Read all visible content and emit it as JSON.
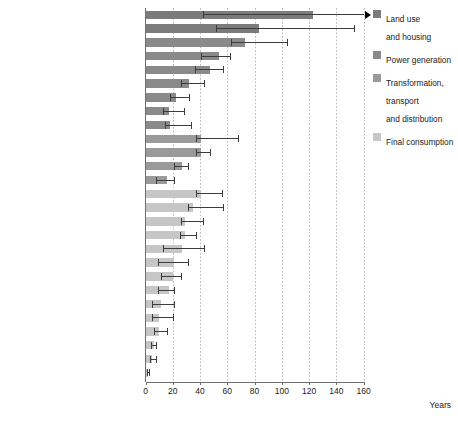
{
  "chart_data": {
    "type": "bar",
    "title": "",
    "xlabel": "Years",
    "ylabel": "",
    "xlim": [
      0,
      160
    ],
    "xticks": [
      0,
      20,
      40,
      60,
      80,
      100,
      120,
      140,
      160
    ],
    "grid": "vertical dotted gridlines at each x tick",
    "orientation": "horizontal",
    "legend_position": "right",
    "value_unit": "years",
    "legend": [
      {
        "label": "Land use\nand housing",
        "color": "#7b7b7b"
      },
      {
        "label": "Power generation",
        "color": "#8a8a8a"
      },
      {
        "label": "Transformation,\ntransport\nand distribution",
        "color": "#9a9a9a"
      },
      {
        "label": "Final consumption",
        "color": "#c6c6c6"
      }
    ],
    "categories": [
      "Urban infrastructure (e.g. roads)",
      "Building stock",
      "Large hydropower plant",
      "Nuclear power plant",
      "Coal-fired power plant",
      "Combined-cycle gas turbine plant",
      "Offshore wind turbines",
      "Onshore wind turbines",
      "Solar photovoltaics",
      "Transmission and distribution networks",
      "Pipelines",
      "Oil refineries",
      "Refueling stations",
      "Cement plant",
      "Steel plant",
      "Petrochemical plant",
      "Aircraft",
      "Manufacturing equipment",
      "Residential space heating and cooling",
      "Commercial heating and cooling",
      "Passenger cars",
      "Household appliances",
      "Residential water heating",
      "Consumer electronics",
      "Light bulbs (fluorescent)",
      "Office equipment",
      "Light bulbs (incandescent)"
    ],
    "series": [
      {
        "name": "Typical lifetime",
        "values": [
          123,
          83,
          73,
          54,
          47,
          32,
          22,
          17,
          18,
          41,
          41,
          27,
          16,
          41,
          35,
          29,
          29,
          27,
          21,
          20,
          17,
          11,
          10,
          10,
          6,
          5,
          1.5
        ],
        "low": [
          42,
          52,
          63,
          41,
          36,
          26,
          18,
          13,
          14,
          37,
          37,
          21,
          8,
          37,
          31,
          26,
          25,
          13,
          9,
          11,
          9,
          5,
          5,
          6,
          4,
          3.5,
          0.7
        ],
        "high": [
          160,
          153,
          104,
          62,
          57,
          43,
          32,
          28,
          33,
          68,
          47,
          31,
          21,
          56,
          57,
          42,
          37,
          43,
          31,
          26,
          21,
          21,
          20,
          16,
          8,
          8,
          2.5
        ],
        "high_open": [
          true,
          false,
          false,
          false,
          false,
          false,
          false,
          false,
          false,
          false,
          false,
          false,
          false,
          false,
          false,
          false,
          false,
          false,
          false,
          false,
          false,
          false,
          false,
          false,
          false,
          false,
          false
        ]
      }
    ],
    "group_of_category": [
      "land-use",
      "land-use",
      "power",
      "power",
      "power",
      "power",
      "power",
      "power",
      "power",
      "transformation",
      "transformation",
      "transformation",
      "transformation",
      "final",
      "final",
      "final",
      "final",
      "final",
      "final",
      "final",
      "final",
      "final",
      "final",
      "final",
      "final",
      "final",
      "final"
    ],
    "group_colors": {
      "land-use": "#7b7b7b",
      "power": "#8a8a8a",
      "transformation": "#9a9a9a",
      "final": "#c6c6c6"
    }
  }
}
